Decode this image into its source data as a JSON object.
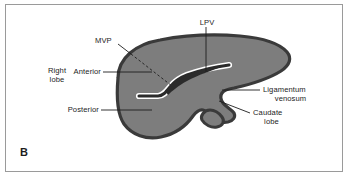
{
  "figure": {
    "panel_letter": "B",
    "type": "anatomical-diagram",
    "colors": {
      "background": "#ffffff",
      "frame_border": "#9a9a9a",
      "liver_fill": "#7d7d7d",
      "liver_outline": "#3a3a3a",
      "vessel_fill": "#2b2b2b",
      "vessel_highlight": "#ffffff",
      "label_text": "#1d1d1d",
      "leader_line": "#1d1d1d"
    }
  },
  "labels": {
    "lpv": "LPV",
    "mvp": "MVP",
    "right_lobe_line1": "Right",
    "right_lobe_line2": "lobe",
    "anterior": "Anterior",
    "posterior": "Posterior",
    "ligamentum_line1": "Ligamentum",
    "ligamentum_line2": "venosum",
    "caudate_line1": "Caudate",
    "caudate_line2": "lobe"
  }
}
